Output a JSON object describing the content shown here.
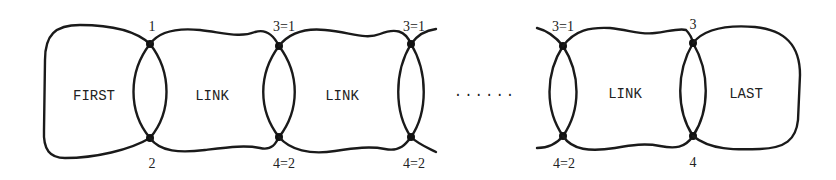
{
  "diagram": {
    "blocks": [
      {
        "label": "FIRST"
      },
      {
        "label": "LINK"
      },
      {
        "label": "LINK"
      },
      {
        "label": "LINK"
      },
      {
        "label": "LAST"
      }
    ],
    "ellipsis": "......",
    "junctions": [
      {
        "top": "1",
        "bottom": "2"
      },
      {
        "top": "3=1",
        "bottom": "4=2"
      },
      {
        "top": "3=1",
        "bottom": "4=2"
      },
      {
        "top": "3=1",
        "bottom": "4=2"
      },
      {
        "top": "3",
        "bottom": "4"
      }
    ]
  }
}
